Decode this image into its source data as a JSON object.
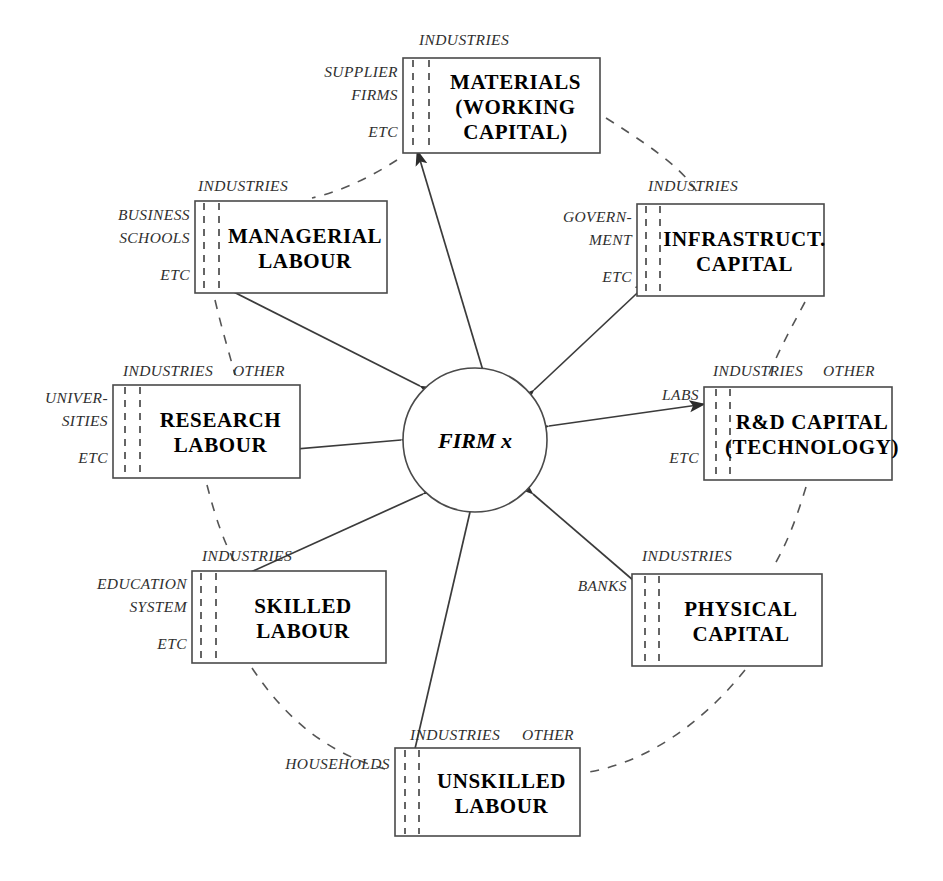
{
  "diagram": {
    "center": {
      "label": "FIRM x",
      "shape": "circle",
      "cx": 475,
      "cy": 440,
      "r": 72
    },
    "colors": {
      "box_stroke": "#4a4a4a",
      "text": "#000000",
      "label_text": "#2f2f2f",
      "arrow": "#3b3b3b",
      "arc_dash": "#555555",
      "background": "#ffffff"
    },
    "common_labels": {
      "industries": "INDUSTRIES",
      "other": "OTHER",
      "etc": "ETC"
    },
    "nodes": [
      {
        "id": "materials",
        "title_lines": [
          "MATERIALS",
          "(WORKING",
          "CAPITAL)"
        ],
        "x": 403,
        "y": 58,
        "w": 197,
        "h": 95,
        "top_labels": [
          {
            "text": "INDUSTRIES",
            "x": 464,
            "y": 45
          }
        ],
        "left_labels": [
          {
            "text": "SUPPLIER",
            "x": 398,
            "y": 77
          },
          {
            "text": "FIRMS",
            "x": 398,
            "y": 100
          },
          {
            "text": "ETC",
            "x": 398,
            "y": 137
          }
        ],
        "dash_x": [
          413,
          429
        ],
        "arrow": {
          "from": [
            490,
            394
          ],
          "to": [
            417,
            150
          ],
          "head_start": true,
          "head_end": true
        }
      },
      {
        "id": "managerial",
        "title_lines": [
          "MANAGERIAL",
          "LABOUR"
        ],
        "x": 195,
        "y": 201,
        "w": 192,
        "h": 92,
        "top_labels": [
          {
            "text": "INDUSTRIES",
            "x": 243,
            "y": 191
          }
        ],
        "left_labels": [
          {
            "text": "BUSINESS",
            "x": 190,
            "y": 220
          },
          {
            "text": "SCHOOLS",
            "x": 190,
            "y": 243
          },
          {
            "text": "ETC",
            "x": 190,
            "y": 280
          }
        ],
        "dash_x": [
          204,
          219
        ],
        "arrow": {
          "from": [
            420,
            386
          ],
          "to": [
            212,
            281
          ],
          "head_start": true,
          "head_end": true
        }
      },
      {
        "id": "infrastructure",
        "title_lines": [
          "INFRASTRUCT.",
          "CAPITAL"
        ],
        "x": 637,
        "y": 204,
        "w": 187,
        "h": 92,
        "top_labels": [
          {
            "text": "INDUSTRIES",
            "x": 693,
            "y": 191
          }
        ],
        "left_labels": [
          {
            "text": "GOVERN-",
            "x": 632,
            "y": 222
          },
          {
            "text": "MENT",
            "x": 632,
            "y": 245
          },
          {
            "text": "ETC",
            "x": 632,
            "y": 282
          }
        ],
        "dash_x": [
          646,
          660
        ],
        "arrow": {
          "from": [
            534,
            390
          ],
          "to": [
            650,
            281
          ],
          "head_start": true,
          "head_end": true
        }
      },
      {
        "id": "research",
        "title_lines": [
          "RESEARCH",
          "LABOUR"
        ],
        "x": 113,
        "y": 385,
        "w": 187,
        "h": 93,
        "top_labels": [
          {
            "text": "INDUSTRIES",
            "x": 168,
            "y": 376
          },
          {
            "text": "OTHER",
            "x": 259,
            "y": 376
          }
        ],
        "left_labels": [
          {
            "text": "UNIVER-",
            "x": 108,
            "y": 403
          },
          {
            "text": "SITIES",
            "x": 108,
            "y": 426
          },
          {
            "text": "ETC",
            "x": 108,
            "y": 463
          }
        ],
        "dash_x": [
          125,
          140
        ],
        "arrow": {
          "from": [
            401,
            440
          ],
          "to": [
            131,
            463
          ],
          "head_start": true,
          "head_end": true
        }
      },
      {
        "id": "rd",
        "title_lines": [
          "R&D CAPITAL",
          "(TECHNOLOGY)"
        ],
        "x": 704,
        "y": 387,
        "w": 188,
        "h": 93,
        "top_labels": [
          {
            "text": "INDUSTRIES",
            "x": 758,
            "y": 376
          },
          {
            "text": "OTHER",
            "x": 849,
            "y": 376
          }
        ],
        "left_labels": [
          {
            "text": "LABS",
            "x": 699,
            "y": 400
          },
          {
            "text": "ETC",
            "x": 699,
            "y": 463
          }
        ],
        "dash_x": [
          716,
          730
        ],
        "arrow": {
          "from": [
            549,
            426
          ],
          "to": [
            705,
            404
          ],
          "head_start": true,
          "head_end": true
        }
      },
      {
        "id": "skilled",
        "title_lines": [
          "SKILLED",
          "LABOUR"
        ],
        "x": 192,
        "y": 571,
        "w": 194,
        "h": 92,
        "top_labels": [
          {
            "text": "INDUSTRIES",
            "x": 247,
            "y": 561
          }
        ],
        "left_labels": [
          {
            "text": "EDUCATION",
            "x": 187,
            "y": 589
          },
          {
            "text": "SYSTEM",
            "x": 187,
            "y": 612
          },
          {
            "text": "ETC",
            "x": 187,
            "y": 649
          }
        ],
        "dash_x": [
          201,
          216
        ],
        "arrow": {
          "from": [
            423,
            494
          ],
          "to": [
            209,
            591
          ],
          "head_start": true,
          "head_end": true
        }
      },
      {
        "id": "physical",
        "title_lines": [
          "PHYSICAL",
          "CAPITAL"
        ],
        "x": 632,
        "y": 574,
        "w": 190,
        "h": 92,
        "top_labels": [
          {
            "text": "INDUSTRIES",
            "x": 687,
            "y": 561
          }
        ],
        "left_labels": [
          {
            "text": "BANKS",
            "x": 627,
            "y": 591
          }
        ],
        "dash_x": [
          645,
          659
        ],
        "arrow": {
          "from": [
            533,
            494
          ],
          "to": [
            648,
            593
          ],
          "head_start": true,
          "head_end": true
        }
      },
      {
        "id": "unskilled",
        "title_lines": [
          "UNSKILLED",
          "LABOUR"
        ],
        "x": 395,
        "y": 748,
        "w": 185,
        "h": 88,
        "top_labels": [
          {
            "text": "INDUSTRIES",
            "x": 455,
            "y": 740
          },
          {
            "text": "OTHER",
            "x": 548,
            "y": 740
          }
        ],
        "left_labels": [
          {
            "text": "HOUSEHOLDS",
            "x": 390,
            "y": 769
          }
        ],
        "dash_x": [
          405,
          419
        ],
        "arrow": {
          "from": [
            470,
            512
          ],
          "to": [
            411,
            766
          ],
          "head_start": true,
          "head_end": true
        }
      }
    ],
    "arcs": [
      {
        "id": "arc-materials-managerial",
        "d": "M 397,160 C 372,176 345,190 312,198"
      },
      {
        "id": "arc-materials-infrastructure",
        "d": "M 606,118 C 660,152 686,172 700,197"
      },
      {
        "id": "arc-managerial-research",
        "d": "M 215,300 C 222,330 229,352 235,375"
      },
      {
        "id": "arc-infrastructure-rd",
        "d": "M 805,302 C 790,330 778,352 768,377"
      },
      {
        "id": "arc-research-skilled",
        "d": "M 207,485 C 216,520 225,545 237,566"
      },
      {
        "id": "arc-rd-physical",
        "d": "M 806,487 C 796,520 786,546 772,569"
      },
      {
        "id": "arc-skilled-unskilled",
        "d": "M 252,668 C 288,722 330,754 385,769"
      },
      {
        "id": "arc-physical-unskilled",
        "d": "M 745,670 C 700,726 645,762 589,772"
      }
    ]
  }
}
